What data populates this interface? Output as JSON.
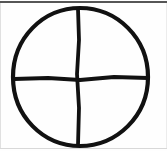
{
  "figure": {
    "background_color": "#fefefe",
    "ink_color": "#111111",
    "stroke_width_px": 4,
    "canvas": {
      "width": 167,
      "height": 151
    }
  },
  "shapes": {
    "circle": {
      "name": "hand-drawn-circle",
      "center_x": 80,
      "center_y": 77,
      "radius_x": 68,
      "radius_y": 69,
      "left_px": 12,
      "right_px": 149,
      "top_px": 8,
      "bottom_px": 146,
      "path": "M 80 8 C 117 8 148 38 148 77 C 148 116 117 146 80 146 C 43 146 13 116 13 77 C 13 38 43 8 80 8 Z"
    },
    "vertical_line": {
      "name": "vertical-divider",
      "x1": 78,
      "y1": 9,
      "x2": 79,
      "y2": 145,
      "path": "M 78 9 L 79 40 L 77 74 L 79 108 L 78 145"
    },
    "horizontal_line": {
      "name": "horizontal-divider",
      "x1": 14,
      "y1": 79,
      "x2": 148,
      "y2": 78,
      "path": "M 14 79 L 48 78 L 80 80 L 114 77 L 148 78"
    }
  },
  "edges": {
    "top_rule": {
      "name": "top-border-rule",
      "color": "#565656"
    },
    "bottom_rule": {
      "name": "bottom-border-rule",
      "color": "#d8d8d8"
    },
    "left_rule": {
      "name": "left-border-rule",
      "color": "#e0e0e0"
    },
    "right_rule": {
      "name": "right-border-rule",
      "color": "#ececec"
    }
  },
  "quadrants": [
    {
      "name": "upper-left-quadrant",
      "label": ""
    },
    {
      "name": "upper-right-quadrant",
      "label": ""
    },
    {
      "name": "lower-left-quadrant",
      "label": ""
    },
    {
      "name": "lower-right-quadrant",
      "label": ""
    }
  ]
}
